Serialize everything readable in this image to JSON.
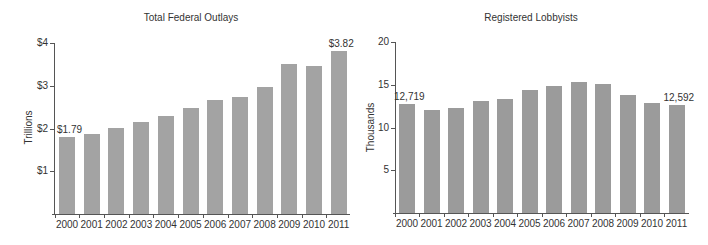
{
  "chart_data": [
    {
      "type": "bar",
      "title": "Total Federal Outlays",
      "xlabel": "",
      "ylabel": "Trillions",
      "categories": [
        "2000",
        "2001",
        "2002",
        "2003",
        "2004",
        "2005",
        "2006",
        "2007",
        "2008",
        "2009",
        "2010",
        "2011"
      ],
      "values": [
        1.79,
        1.86,
        2.01,
        2.16,
        2.29,
        2.47,
        2.66,
        2.73,
        2.98,
        3.52,
        3.46,
        3.82
      ],
      "ylim": [
        0,
        4
      ],
      "yticks": [
        "$1",
        "$2",
        "$3",
        "$4"
      ],
      "annotations": [
        {
          "category": "2000",
          "label": "$1.79"
        },
        {
          "category": "2011",
          "label": "$3.82"
        }
      ],
      "grid": false,
      "legend": null,
      "bar_color": "#a3a3a3"
    },
    {
      "type": "bar",
      "title": "Registered Lobbyists",
      "xlabel": "",
      "ylabel": "Thousands",
      "categories": [
        "2000",
        "2001",
        "2002",
        "2003",
        "2004",
        "2005",
        "2006",
        "2007",
        "2008",
        "2009",
        "2010",
        "2011"
      ],
      "values": [
        12.719,
        12.1,
        12.3,
        13.1,
        13.3,
        14.4,
        14.8,
        15.3,
        15.1,
        13.8,
        12.9,
        12.592
      ],
      "ylim": [
        0,
        20
      ],
      "yticks": [
        "5",
        "10",
        "15",
        "20"
      ],
      "annotations": [
        {
          "category": "2000",
          "label": "12,719"
        },
        {
          "category": "2011",
          "label": "12,592"
        }
      ],
      "grid": false,
      "legend": null,
      "bar_color": "#9b9b9b"
    }
  ]
}
